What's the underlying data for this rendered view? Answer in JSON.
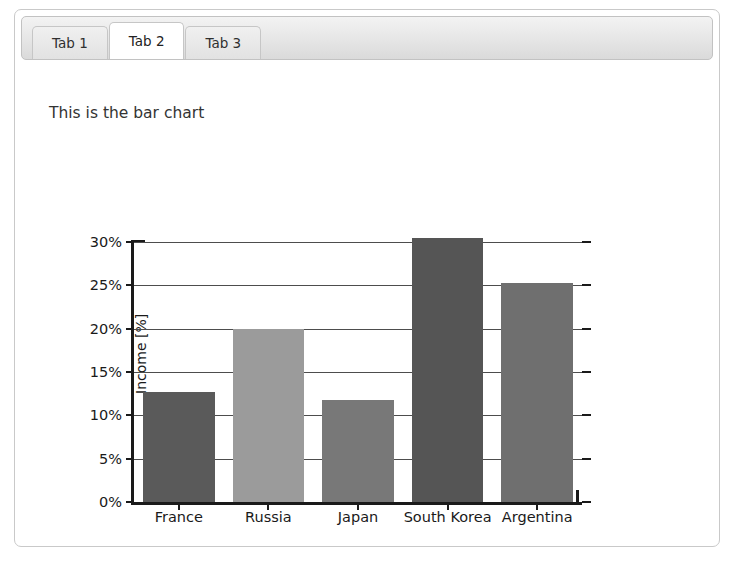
{
  "window": {
    "panel_name": "tab-panel"
  },
  "tabs": [
    {
      "label": "Tab 1",
      "active": false
    },
    {
      "label": "Tab 2",
      "active": true
    },
    {
      "label": "Tab 3",
      "active": false
    }
  ],
  "content": {
    "heading": "This is the bar chart"
  },
  "chart_data": {
    "type": "bar",
    "title": "",
    "xlabel": "",
    "ylabel": "Income [%]",
    "categories": [
      "France",
      "Russia",
      "Japan",
      "South Korea",
      "Argentina"
    ],
    "values": [
      12.7,
      20.0,
      11.8,
      30.5,
      25.3
    ],
    "value_labels": [
      "12.7%",
      "20.0%",
      "11.8%",
      "30.5%",
      "25.3%"
    ],
    "colors": [
      "#5a5a5a",
      "#9b9b9b",
      "#787878",
      "#555555",
      "#6f6f6f"
    ],
    "ylim": [
      0,
      30
    ],
    "ytick_values": [
      0,
      5,
      10,
      15,
      20,
      25,
      30
    ],
    "ytick_labels": [
      "0%",
      "5%",
      "10%",
      "15%",
      "20%",
      "25%",
      "30%"
    ],
    "grid": true,
    "grid_axis": "y",
    "legend": false,
    "legend_position": "none",
    "axis_color": "#1a1a1a",
    "background": "#ffffff"
  }
}
